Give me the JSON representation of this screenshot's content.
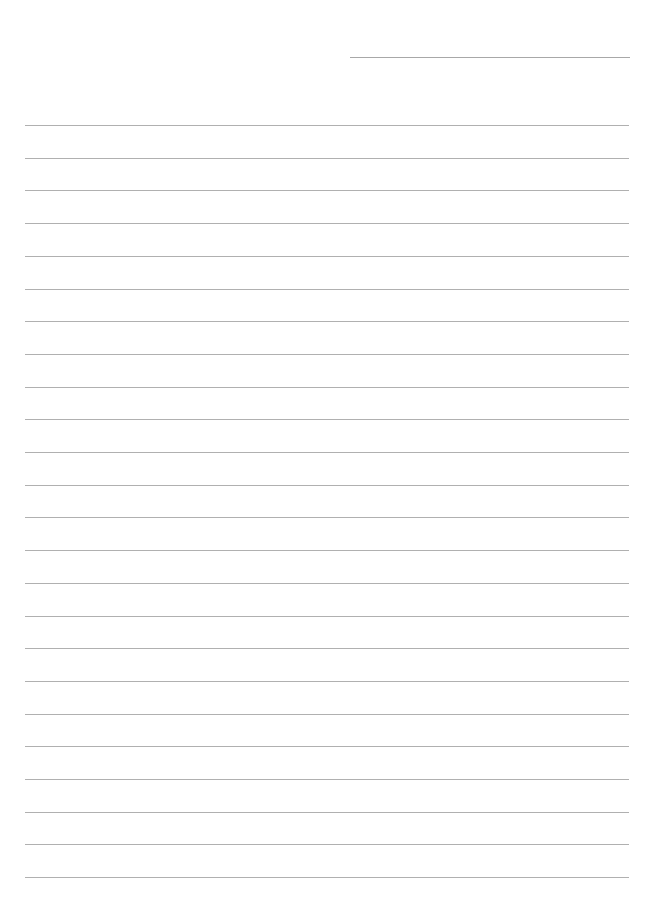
{
  "page": {
    "type": "lined-paper",
    "background": "#ffffff",
    "line_color": "#b0b0b0",
    "header_line": {
      "top": 57,
      "left": 350,
      "width": 280
    },
    "rules": {
      "count": 24,
      "first_top": 125,
      "spacing": 32.7,
      "left": 25,
      "width": 604
    }
  }
}
